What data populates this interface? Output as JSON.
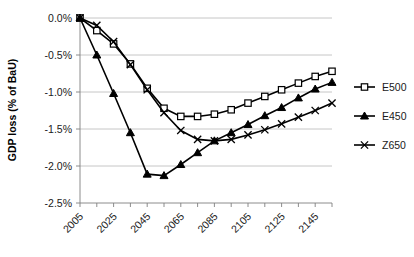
{
  "chart_data": {
    "type": "line",
    "title": "",
    "xlabel": "",
    "ylabel": "GDP loss (% of BaU)",
    "x": [
      2005,
      2015,
      2025,
      2035,
      2045,
      2055,
      2065,
      2075,
      2085,
      2095,
      2105,
      2115,
      2125,
      2135,
      2145,
      2155
    ],
    "xtick_labels": [
      "2005",
      "2025",
      "2045",
      "2065",
      "2085",
      "2105",
      "2125",
      "2145"
    ],
    "xtick_values": [
      2005,
      2025,
      2045,
      2065,
      2085,
      2105,
      2125,
      2145
    ],
    "xlim": [
      2005,
      2155
    ],
    "ytick_labels": [
      "0.0%",
      "-0.5%",
      "-1.0%",
      "-1.5%",
      "-2.0%",
      "-2.5%"
    ],
    "ytick_values": [
      0.0,
      -0.5,
      -1.0,
      -1.5,
      -2.0,
      -2.5
    ],
    "ylim": [
      -2.5,
      0.0
    ],
    "grid": "horizontal",
    "legend_position": "right",
    "series": [
      {
        "name": "E500",
        "marker": "open-square",
        "values": [
          0.0,
          -0.17,
          -0.35,
          -0.62,
          -0.95,
          -1.22,
          -1.33,
          -1.33,
          -1.3,
          -1.24,
          -1.15,
          -1.06,
          -0.97,
          -0.88,
          -0.79,
          -0.72
        ]
      },
      {
        "name": "E450",
        "marker": "filled-triangle",
        "values": [
          0.0,
          -0.5,
          -1.02,
          -1.55,
          -2.11,
          -2.13,
          -1.98,
          -1.82,
          -1.66,
          -1.55,
          -1.44,
          -1.32,
          -1.21,
          -1.08,
          -0.96,
          -0.87
        ]
      },
      {
        "name": "Z650",
        "marker": "x",
        "values": [
          0.0,
          -0.1,
          -0.32,
          -0.63,
          -0.97,
          -1.28,
          -1.52,
          -1.64,
          -1.66,
          -1.64,
          -1.58,
          -1.51,
          -1.43,
          -1.34,
          -1.25,
          -1.15
        ]
      }
    ],
    "colors": {
      "series_stroke": "#000000",
      "gridline": "#b8b8b8",
      "axis": "#808080",
      "background": "#ffffff"
    }
  },
  "legend": {
    "items": [
      {
        "label": "E500",
        "marker": "open-square"
      },
      {
        "label": "E450",
        "marker": "filled-triangle"
      },
      {
        "label": "Z650",
        "marker": "x"
      }
    ]
  }
}
